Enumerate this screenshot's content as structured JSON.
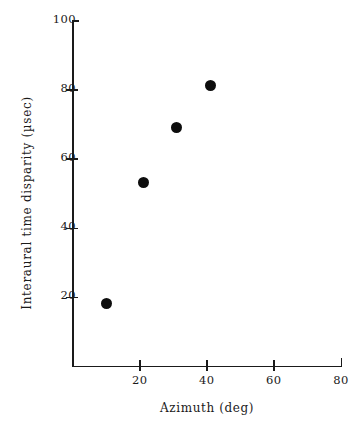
{
  "chart_data": {
    "type": "scatter",
    "title": "",
    "xlabel": "Azimuth (deg)",
    "ylabel": "Interaural time disparity  (µsec)",
    "xlim": [
      0,
      80
    ],
    "ylim": [
      0,
      100
    ],
    "xticks": [
      20,
      40,
      60,
      80
    ],
    "yticks": [
      20,
      40,
      60,
      80,
      100
    ],
    "xtick_labels": [
      "20",
      "40",
      "60",
      "80"
    ],
    "ytick_labels": [
      "20",
      "40",
      "60",
      "80",
      "100"
    ],
    "grid": false,
    "legend": null,
    "marker": "filled-circle",
    "marker_color": "#0d0d0d",
    "series": [
      {
        "name": "Interaural time disparity",
        "x": [
          10,
          21,
          31,
          41
        ],
        "y": [
          18,
          53,
          69,
          81
        ]
      }
    ]
  },
  "figure": {
    "background_color": "#ffffff",
    "axis_color": "#1a1a1a"
  }
}
